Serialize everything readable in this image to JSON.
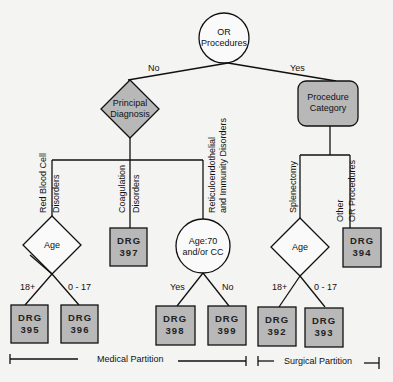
{
  "diagram": {
    "root": {
      "line1": "OR",
      "line2": "Procedures"
    },
    "edges": {
      "no": "No",
      "yes": "Yes"
    },
    "principal_diagnosis": {
      "line1": "Principal",
      "line2": "Diagnosis"
    },
    "procedure_category": {
      "line1": "Procedure",
      "line2": "Category"
    },
    "branches": {
      "rbc": {
        "line1": "Red Blood Cell",
        "line2": "Disorders"
      },
      "coag": {
        "line1": "Coagulation",
        "line2": "Disorders"
      },
      "reticulo": {
        "line1": "Reticuloendothelial",
        "line2": "and Immunity Disorders"
      },
      "splenectomy": {
        "line1": "Splenectomy"
      },
      "other_or": {
        "line1": "Other",
        "line2": "OR Procedures"
      }
    },
    "decisions": {
      "age_medical": "Age",
      "age_cc": {
        "line1": "Age:70",
        "line2": "and/or CC"
      },
      "age_surgical": "Age"
    },
    "branch_labels": {
      "age_18": "18+",
      "age_0_17": "0 - 17",
      "yes": "Yes",
      "no": "No"
    },
    "drgs": [
      {
        "label": "DRG",
        "num": "395"
      },
      {
        "label": "DRG",
        "num": "396"
      },
      {
        "label": "DRG",
        "num": "397"
      },
      {
        "label": "DRG",
        "num": "398"
      },
      {
        "label": "DRG",
        "num": "399"
      },
      {
        "label": "DRG",
        "num": "392"
      },
      {
        "label": "DRG",
        "num": "393"
      },
      {
        "label": "DRG",
        "num": "394"
      }
    ],
    "partitions": {
      "medical": "Medical Partition",
      "surgical": "Surgical Partition"
    }
  }
}
